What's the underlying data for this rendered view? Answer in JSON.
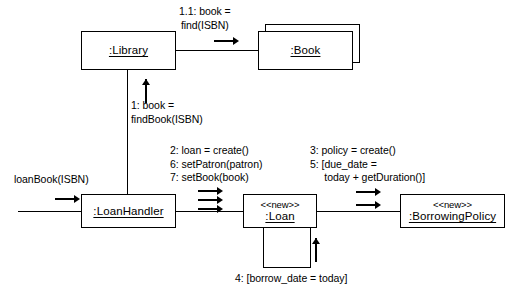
{
  "diagram": {
    "type": "uml-communication-diagram",
    "background_color": "#ffffff",
    "line_color": "#000000"
  },
  "objects": [
    {
      "id": "library",
      "name": ":Library",
      "stereotype": "",
      "multiplicity": "single"
    },
    {
      "id": "book",
      "name": ":Book",
      "stereotype": "",
      "multiplicity": "multi"
    },
    {
      "id": "loanhandler",
      "name": ":LoanHandler",
      "stereotype": "",
      "multiplicity": "single"
    },
    {
      "id": "loan",
      "name": ":Loan",
      "stereotype": "<<new>>",
      "multiplicity": "single"
    },
    {
      "id": "borrowingpolicy",
      "name": ":BorrowingPolicy",
      "stereotype": "<<new>>",
      "multiplicity": "single"
    }
  ],
  "messages": {
    "entry": "loanBook(ISBN)",
    "library_to_book": "1.1: book =\nfind(ISBN)",
    "handler_to_library": "1: book =\nfindBook(ISBN)",
    "handler_to_loan": "2: loan = create()\n6: setPatron(patron)\n7: setBook(book)",
    "loan_to_policy": "3: policy = create()\n5: [due_date =\n     today + getDuration()]",
    "loan_self": "4: [borrow_date = today]"
  }
}
